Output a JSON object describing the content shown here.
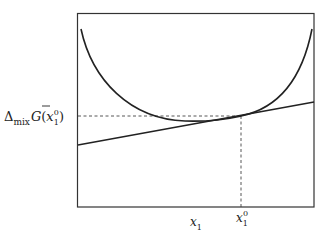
{
  "diagram": {
    "title": "",
    "y_label": {
      "delta": "Δ",
      "sub_mix": "mix",
      "G": "G",
      "paren_open": "(",
      "x": "x",
      "x_sub": "1",
      "x_sup": "0",
      "paren_close": ")"
    },
    "x_labels": {
      "x1": {
        "main": "x",
        "sub": "1"
      },
      "x1_0": {
        "main": "x",
        "sub": "1",
        "sup": "0"
      }
    },
    "elements": [
      "frame box",
      "U-shaped Gibbs energy of mixing curve",
      "tangent line at x1^0",
      "dashed horizontal guide to y-axis label",
      "dashed vertical guide to x1^0 tick"
    ],
    "colors": {
      "ink": "#222222",
      "background": "#ffffff"
    }
  }
}
